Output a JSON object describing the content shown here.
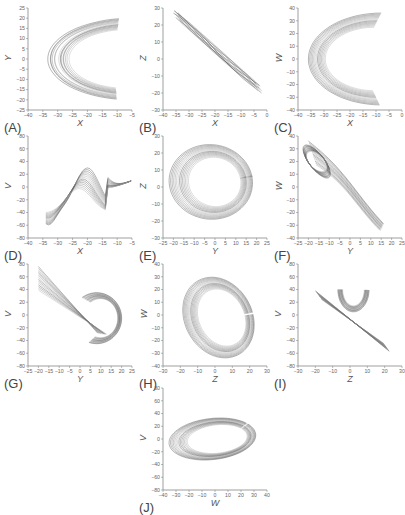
{
  "chart_data": [
    {
      "id": "A",
      "type": "line",
      "panel_label": "(A)",
      "xlabel": "X",
      "ylabel": "Y",
      "xlim": [
        -40,
        -5
      ],
      "ylim": [
        -25,
        25
      ],
      "xticks": [
        -40,
        -35,
        -30,
        -25,
        -20,
        -15,
        -10,
        -5
      ],
      "yticks": [
        -25,
        -20,
        -15,
        -10,
        -5,
        0,
        5,
        10,
        15,
        20,
        25
      ],
      "description": "nested C-shaped orbits, leftmost at X≈-35, open to the right"
    },
    {
      "id": "B",
      "type": "line",
      "panel_label": "(B)",
      "xlabel": "X",
      "ylabel": "Z",
      "xlim": [
        -40,
        0
      ],
      "ylim": [
        -30,
        30
      ],
      "xticks": [
        -40,
        -35,
        -30,
        -25,
        -20,
        -15,
        -10,
        -5,
        0
      ],
      "yticks": [
        -30,
        -20,
        -10,
        0,
        10,
        20,
        30
      ],
      "description": "narrow diagonal band from (-36,27) to (-2,-20)"
    },
    {
      "id": "C",
      "type": "line",
      "panel_label": "(C)",
      "xlabel": "X",
      "ylabel": "W",
      "xlim": [
        -40,
        0
      ],
      "ylim": [
        -40,
        40
      ],
      "xticks": [
        -40,
        -35,
        -30,
        -25,
        -20,
        -15,
        -10,
        -5,
        0
      ],
      "yticks": [
        -40,
        -30,
        -20,
        -10,
        0,
        10,
        20,
        30,
        40
      ],
      "description": "nested loops, left edge X≈-36, W range -35 to 37"
    },
    {
      "id": "D",
      "type": "line",
      "panel_label": "(D)",
      "xlabel": "X",
      "ylabel": "V",
      "xlim": [
        -40,
        -5
      ],
      "ylim": [
        -80,
        80
      ],
      "xticks": [
        -40,
        -35,
        -30,
        -25,
        -20,
        -15,
        -10,
        -5
      ],
      "yticks": [
        -80,
        -60,
        -40,
        -20,
        0,
        20,
        40,
        60,
        80
      ],
      "description": "wave-like loops peaking V≈75 at X≈-20, trough V≈-65 at X≈-33"
    },
    {
      "id": "E",
      "type": "line",
      "panel_label": "(E)",
      "xlabel": "Y",
      "ylabel": "Z",
      "xlim": [
        -25,
        25
      ],
      "ylim": [
        -30,
        30
      ],
      "xticks": [
        -25,
        -20,
        -15,
        -10,
        -5,
        0,
        5,
        10,
        15,
        20,
        25
      ],
      "yticks": [
        -30,
        -20,
        -10,
        0,
        10,
        20,
        30
      ],
      "description": "nested ellipses centered near (0,2)"
    },
    {
      "id": "F",
      "type": "line",
      "panel_label": "(F)",
      "xlabel": "Y",
      "ylabel": "W",
      "xlim": [
        -25,
        25
      ],
      "ylim": [
        -40,
        40
      ],
      "xticks": [
        -25,
        -20,
        -15,
        -10,
        -5,
        0,
        5,
        10,
        15,
        20,
        25
      ],
      "yticks": [
        -40,
        -30,
        -20,
        -10,
        0,
        10,
        20,
        30,
        40
      ],
      "description": "diagonal band from (-20,37) down to (20,-35)"
    },
    {
      "id": "G",
      "type": "line",
      "panel_label": "(G)",
      "xlabel": "Y",
      "ylabel": "V",
      "xlim": [
        -25,
        25
      ],
      "ylim": [
        -80,
        80
      ],
      "xticks": [
        -25,
        -20,
        -15,
        -10,
        -5,
        0,
        5,
        10,
        15,
        20,
        25
      ],
      "yticks": [
        -80,
        -60,
        -40,
        -20,
        0,
        20,
        40,
        60,
        80
      ],
      "description": "figure-eight style loops, peak V≈78 at Y≈-20, right lobe to Y≈20"
    },
    {
      "id": "H",
      "type": "line",
      "panel_label": "(H)",
      "xlabel": "Z",
      "ylabel": "W",
      "xlim": [
        -30,
        30
      ],
      "ylim": [
        -40,
        40
      ],
      "xticks": [
        -30,
        -20,
        -10,
        0,
        10,
        20,
        30
      ],
      "yticks": [
        -40,
        -30,
        -20,
        -10,
        0,
        10,
        20,
        30,
        40
      ],
      "description": "heart-shaped orbits, lobe up to W≈37 at Z≈10"
    },
    {
      "id": "I",
      "type": "line",
      "panel_label": "(I)",
      "xlabel": "Z",
      "ylabel": "V",
      "xlim": [
        -30,
        30
      ],
      "ylim": [
        -80,
        80
      ],
      "xticks": [
        -30,
        -20,
        -10,
        0,
        10,
        20,
        30
      ],
      "yticks": [
        -80,
        -60,
        -40,
        -20,
        0,
        20,
        40,
        60,
        80
      ],
      "description": "loops peaking V≈75 at Z≈-3, diagonal band to (25,-70)"
    },
    {
      "id": "J",
      "type": "line",
      "panel_label": "(J)",
      "xlabel": "W",
      "ylabel": "V",
      "xlim": [
        -40,
        40
      ],
      "ylim": [
        -80,
        80
      ],
      "xticks": [
        -40,
        -30,
        -20,
        -10,
        0,
        10,
        20,
        30,
        40
      ],
      "yticks": [
        -80,
        -60,
        -40,
        -20,
        0,
        20,
        40,
        60,
        80
      ],
      "description": "tilted elliptical orbits from (-33,-50) to (35,80) with a small lobe near W≈12"
    }
  ],
  "line_color": "#555555"
}
